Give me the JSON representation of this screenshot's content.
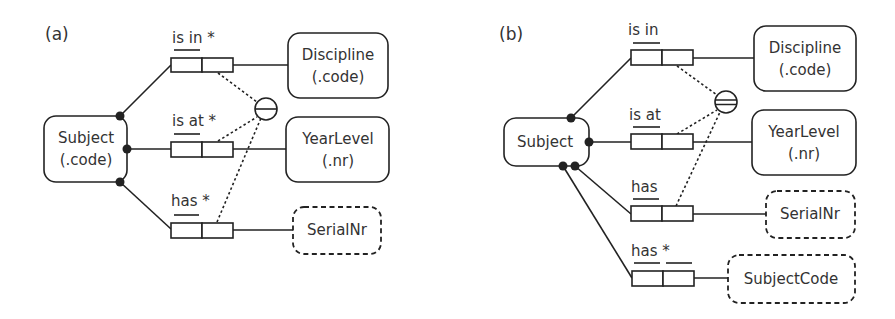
{
  "panels": [
    {
      "label": "(a)",
      "entities": [
        {
          "id": "subject",
          "line1": "Subject",
          "line2": "(.code)",
          "kind": "entity"
        },
        {
          "id": "discipline",
          "line1": "Discipline",
          "line2": "(.code)",
          "kind": "entity"
        },
        {
          "id": "yearlevel",
          "line1": "YearLevel",
          "line2": "(.nr)",
          "kind": "entity"
        },
        {
          "id": "serialnr",
          "line1": "SerialNr",
          "kind": "value"
        }
      ],
      "fact_types": [
        {
          "reading": "is in *",
          "uniqueness": "first-role",
          "derived": true
        },
        {
          "reading": "is at *",
          "uniqueness": "first-role",
          "derived": true
        },
        {
          "reading": "has *",
          "uniqueness": "first-role",
          "derived": true
        }
      ],
      "constraint": {
        "type": "external-uniqueness",
        "symbol": "single-bar-circle"
      }
    },
    {
      "label": "(b)",
      "entities": [
        {
          "id": "subject",
          "line1": "Subject",
          "kind": "entity"
        },
        {
          "id": "discipline",
          "line1": "Discipline",
          "line2": "(.code)",
          "kind": "entity"
        },
        {
          "id": "yearlevel",
          "line1": "YearLevel",
          "line2": "(.nr)",
          "kind": "entity"
        },
        {
          "id": "serialnr",
          "line1": "SerialNr",
          "kind": "value"
        },
        {
          "id": "subjectcode",
          "line1": "SubjectCode",
          "kind": "value"
        }
      ],
      "fact_types": [
        {
          "reading": "is in",
          "uniqueness": "first-role",
          "derived": false
        },
        {
          "reading": "is at",
          "uniqueness": "first-role",
          "derived": false
        },
        {
          "reading": "has",
          "uniqueness": "first-role",
          "derived": false
        },
        {
          "reading": "has *",
          "uniqueness": "both-roles-separate",
          "derived": true
        }
      ],
      "constraint": {
        "type": "preferred-external-uniqueness",
        "symbol": "double-bar-circle"
      }
    }
  ]
}
